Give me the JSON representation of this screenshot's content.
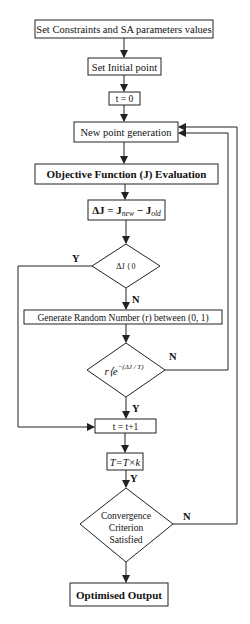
{
  "diagram": {
    "type": "flowchart",
    "nodes": {
      "set_constraints": "Set Constraints and SA parameters values",
      "set_initial": "Set Initial point",
      "t_zero": "t = 0",
      "new_point": "New point generation",
      "objective": "Objective Function (J) Evaluation",
      "delta_j": {
        "prefix": "ΔJ = J",
        "sub1": "new",
        "mid": " − J",
        "sub2": "old"
      },
      "decision_delta": "ΔJ ⟨ 0",
      "generate_random": "Generate Random Number (r) between (0, 1)",
      "decision_prob": {
        "prefix": "r⟨e",
        "sup": "−(ΔJ / T)"
      },
      "t_increment": "t = t+1",
      "temp_update": "T=T×k",
      "decision_convergence": [
        "Convergence",
        "Criterion",
        "Satisfied"
      ],
      "output": "Optimised Output"
    },
    "edge_labels": {
      "delta_yes": "Y",
      "delta_no": "N",
      "prob_no": "N",
      "prob_yes": "Y",
      "temp_yes": "Y",
      "conv_no": "N"
    },
    "colors": {
      "stroke": "#222222",
      "background": "#ffffff",
      "text": "#111111"
    }
  }
}
